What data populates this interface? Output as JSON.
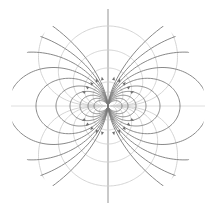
{
  "diagram": {
    "type": "dipole-field",
    "width": 216,
    "height": 211,
    "center": [
      108,
      106
    ],
    "clip_radius": 97,
    "pole_separation": 8,
    "colors": {
      "background": "#ffffff",
      "field_line": "#7a7a7a",
      "equipotential": "#cfcfcf",
      "axis": "#d6d6d6",
      "arrow": "#6e6e6e"
    },
    "field_line_constants": [
      14,
      20,
      28,
      38,
      52,
      72,
      100,
      140,
      200,
      300
    ],
    "equipotential_constants": [
      14,
      24,
      38,
      56,
      80,
      112
    ],
    "arrow_radius": 28
  }
}
